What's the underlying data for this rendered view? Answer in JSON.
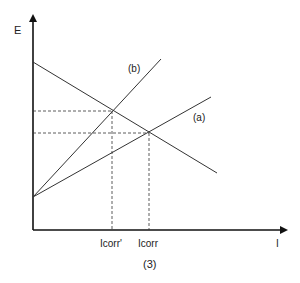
{
  "diagram": {
    "y_axis_label": "E",
    "x_axis_label": "I",
    "line_a_label": "(a)",
    "line_b_label": "(b)",
    "tick_icorr_prime": "Icorr'",
    "tick_icorr": "Icorr",
    "caption": "(3)",
    "colors": {
      "line": "#333333",
      "axis": "#111111"
    }
  }
}
